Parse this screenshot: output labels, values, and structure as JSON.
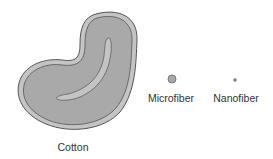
{
  "figure": {
    "background": "#ffffff",
    "fibers": [
      {
        "id": "cotton",
        "label": "Cotton",
        "shape": "kidney-bean cross-section with lumen"
      },
      {
        "id": "microfiber",
        "label": "Microfiber",
        "shape": "small circle"
      },
      {
        "id": "nanofiber",
        "label": "Nanofiber",
        "shape": "tiny dot"
      }
    ],
    "colors": {
      "outline": "#555555",
      "outer_wall": "#c4c4c4",
      "inner_fill": "#a9a9a9",
      "lumen": "#c4c4c4",
      "label_text": "#333333"
    }
  }
}
